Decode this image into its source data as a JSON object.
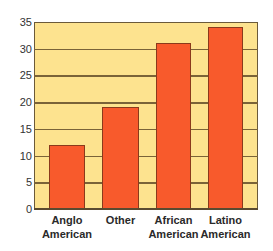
{
  "chart_data": {
    "type": "bar",
    "title": "",
    "xlabel": "",
    "ylabel": "",
    "categories": [
      "Anglo American",
      "Other",
      "African American",
      "Latino American"
    ],
    "category_lines": [
      [
        "Anglo",
        "American"
      ],
      [
        "Other",
        ""
      ],
      [
        "African",
        "American"
      ],
      [
        "Latino",
        "American"
      ]
    ],
    "values": [
      12,
      19,
      31,
      34
    ],
    "ylim": [
      0,
      35
    ],
    "yticks": [
      "0",
      "5",
      "10",
      "15",
      "20",
      "25",
      "30",
      "35"
    ],
    "grid": true,
    "legend": null,
    "colors": {
      "bar": "#F85A2C",
      "bar_border": "#8a3a1c",
      "plot_background": "#FDE38F",
      "gridline": "#7a6338"
    }
  }
}
